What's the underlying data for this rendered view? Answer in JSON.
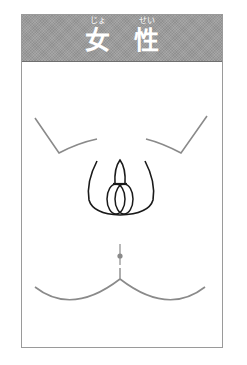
{
  "header": {
    "title_chars": [
      {
        "kanji": "女",
        "ruby": "じょ"
      },
      {
        "kanji": "性",
        "ruby": "せい"
      }
    ],
    "background_color": "#9c9c9c",
    "text_color": "#ffffff"
  },
  "illustration": {
    "subject": "female-body-outline",
    "colors": {
      "outline_gray": "#8a8a8a",
      "outline_black": "#1a1a1a",
      "border": "#9a9a9a"
    }
  }
}
